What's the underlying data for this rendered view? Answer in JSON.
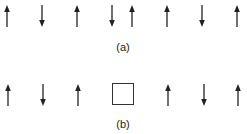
{
  "figure": {
    "panel_a": {
      "label": "(a)",
      "description": "Chain of spins",
      "spins": [
        {
          "x": 7,
          "direction": "up"
        },
        {
          "x": 42,
          "direction": "down"
        },
        {
          "x": 77,
          "direction": "up"
        },
        {
          "x": 112,
          "direction": "down"
        },
        {
          "x": 132,
          "direction": "up"
        },
        {
          "x": 167,
          "direction": "up"
        },
        {
          "x": 202,
          "direction": "down"
        },
        {
          "x": 237,
          "direction": "up"
        }
      ]
    },
    "panel_b": {
      "label": "(b)",
      "description": "Chain of spins with a vacancy (empty site)",
      "sites": [
        {
          "x": 8,
          "type": "spin",
          "direction": "up"
        },
        {
          "x": 43,
          "type": "spin",
          "direction": "down"
        },
        {
          "x": 78,
          "type": "spin",
          "direction": "up"
        },
        {
          "x": 123,
          "type": "vacancy"
        },
        {
          "x": 168,
          "type": "spin",
          "direction": "up"
        },
        {
          "x": 204,
          "type": "spin",
          "direction": "down"
        },
        {
          "x": 238,
          "type": "spin",
          "direction": "up"
        }
      ]
    },
    "colors": {
      "arrow": "#222222",
      "box": "#333333",
      "background": "#ffffff"
    }
  }
}
